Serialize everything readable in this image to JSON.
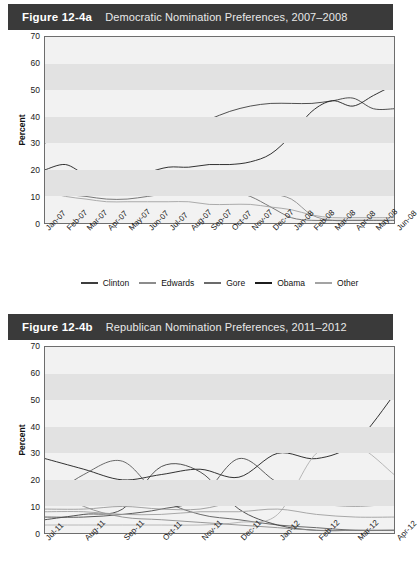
{
  "figures": [
    {
      "number": "Figure 12-4a",
      "title": "Democratic Nomination Preferences, 2007–2008",
      "ylabel": "Percent",
      "legend": [
        {
          "label": "Clinton",
          "color": "#3d3d3d"
        },
        {
          "label": "Edwards",
          "color": "#8c8c8c"
        },
        {
          "label": "Gore",
          "color": "#6b6b6b"
        },
        {
          "label": "Obama",
          "color": "#1c1c1c"
        },
        {
          "label": "Other",
          "color": "#a3a3a3"
        }
      ]
    },
    {
      "number": "Figure 12-4b",
      "title": "Republican Nomination Preferences, 2011–2012",
      "ylabel": "Percent"
    }
  ],
  "chart_data": [
    {
      "type": "line",
      "title": "Democratic Nomination Preferences, 2007–2008",
      "xlabel": "",
      "ylabel": "Percent",
      "ylim": [
        0,
        70
      ],
      "yticks": [
        0,
        10,
        20,
        30,
        40,
        50,
        60,
        70
      ],
      "grid": "horizontal-bands",
      "legend_position": "bottom",
      "x": [
        "Jan-07",
        "Feb-07",
        "Mar-07",
        "Apr-07",
        "May-07",
        "Jun-07",
        "Jul-07",
        "Aug-07",
        "Sep-07",
        "Oct-07",
        "Nov-07",
        "Dec-07",
        "Jan-08",
        "Feb-08",
        "Mar-08",
        "Apr-08",
        "May-08",
        "Jun-08"
      ],
      "series": [
        {
          "name": "Clinton",
          "color": "#3d3d3d",
          "values": [
            30,
            36,
            38,
            35,
            33,
            34,
            35,
            36,
            39,
            42,
            44,
            45,
            45,
            45,
            46,
            47,
            43,
            43
          ]
        },
        {
          "name": "Edwards",
          "color": "#8c8c8c",
          "values": [
            13,
            13,
            12,
            11,
            11,
            12,
            13,
            12,
            12,
            11,
            12,
            11,
            9,
            3,
            1,
            1,
            1,
            1
          ]
        },
        {
          "name": "Gore",
          "color": "#6b6b6b",
          "values": [
            14,
            11,
            10,
            9,
            9,
            10,
            11,
            11,
            13,
            12,
            10,
            6,
            2,
            1,
            1,
            1,
            1,
            1
          ]
        },
        {
          "name": "Obama",
          "color": "#1c1c1c",
          "values": [
            20,
            22,
            18,
            16,
            17,
            19,
            21,
            21,
            22,
            22,
            23,
            26,
            33,
            42,
            46,
            44,
            48,
            52
          ]
        },
        {
          "name": "Other",
          "color": "#a3a3a3",
          "values": [
            12,
            10,
            9,
            8,
            8,
            8,
            8,
            8,
            7,
            7,
            7,
            6,
            5,
            3,
            2,
            2,
            2,
            2
          ]
        }
      ]
    },
    {
      "type": "line",
      "title": "Republican Nomination Preferences, 2011–2012",
      "xlabel": "",
      "ylabel": "Percent",
      "ylim": [
        0,
        70
      ],
      "yticks": [
        0,
        10,
        20,
        30,
        40,
        50,
        60,
        70
      ],
      "grid": "horizontal-bands",
      "legend_position": "none",
      "x": [
        "Jul-11",
        "Aug-11",
        "Sep-11",
        "Oct-11",
        "Nov-11",
        "Dec-11",
        "Jan-12",
        "Feb-12",
        "Mar-12",
        "Apr-12"
      ],
      "series": [
        {
          "name": "Romney",
          "color": "#1c1c1c",
          "values": [
            28,
            24,
            20,
            22,
            24,
            21,
            30,
            28,
            34,
            52
          ]
        },
        {
          "name": "Perry",
          "color": "#5a5a5a",
          "values": [
            12,
            22,
            27,
            13,
            7,
            5,
            3,
            2,
            1,
            1
          ]
        },
        {
          "name": "Cain",
          "color": "#3f3f3f",
          "values": [
            5,
            7,
            9,
            25,
            23,
            9,
            3,
            1,
            1,
            1
          ]
        },
        {
          "name": "Gingrich",
          "color": "#4a4a4a",
          "values": [
            6,
            6,
            7,
            9,
            13,
            28,
            19,
            14,
            16,
            12
          ]
        },
        {
          "name": "Santorum",
          "color": "#b0b0b0",
          "values": [
            3,
            3,
            3,
            3,
            3,
            4,
            7,
            30,
            33,
            22
          ]
        },
        {
          "name": "Bachmann",
          "color": "#8c8c8c",
          "values": [
            18,
            10,
            6,
            5,
            4,
            3,
            2,
            1,
            1,
            1
          ]
        },
        {
          "name": "Paul",
          "color": "#9a9a9a",
          "values": [
            9,
            9,
            10,
            9,
            9,
            12,
            13,
            11,
            10,
            11
          ]
        },
        {
          "name": "Other",
          "color": "#9f9f9f",
          "values": [
            8,
            8,
            7,
            7,
            8,
            8,
            9,
            7,
            6,
            6
          ]
        }
      ]
    }
  ]
}
